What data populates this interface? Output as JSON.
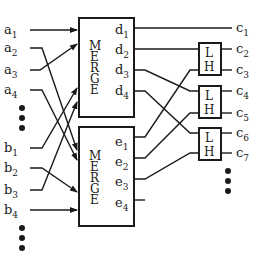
{
  "diagram": {
    "inputs_a": [
      "a",
      "a",
      "a",
      "a"
    ],
    "inputs_a_sub": [
      "1",
      "2",
      "3",
      "4"
    ],
    "inputs_b": [
      "b",
      "b",
      "b",
      "b"
    ],
    "inputs_b_sub": [
      "1",
      "2",
      "3",
      "4"
    ],
    "merge_top": {
      "label_letters": [
        "M",
        "E",
        "R",
        "G",
        "E"
      ],
      "outputs": [
        "d",
        "d",
        "d",
        "d"
      ],
      "outputs_sub": [
        "1",
        "2",
        "3",
        "4"
      ]
    },
    "merge_bottom": {
      "label_letters": [
        "M",
        "E",
        "R",
        "G",
        "E"
      ],
      "outputs": [
        "e",
        "e",
        "e",
        "e"
      ],
      "outputs_sub": [
        "1",
        "2",
        "3",
        "4"
      ]
    },
    "comparators": [
      {
        "low": "L",
        "high": "H"
      },
      {
        "low": "L",
        "high": "H"
      },
      {
        "low": "L",
        "high": "H"
      }
    ],
    "outputs_c": [
      "c",
      "c",
      "c",
      "c",
      "c",
      "c",
      "c"
    ],
    "outputs_c_sub": [
      "1",
      "2",
      "3",
      "4",
      "5",
      "6",
      "7"
    ],
    "ellipsis": "…",
    "colors": {
      "ink": "#1a1a1a",
      "background": "#ffffff"
    }
  }
}
